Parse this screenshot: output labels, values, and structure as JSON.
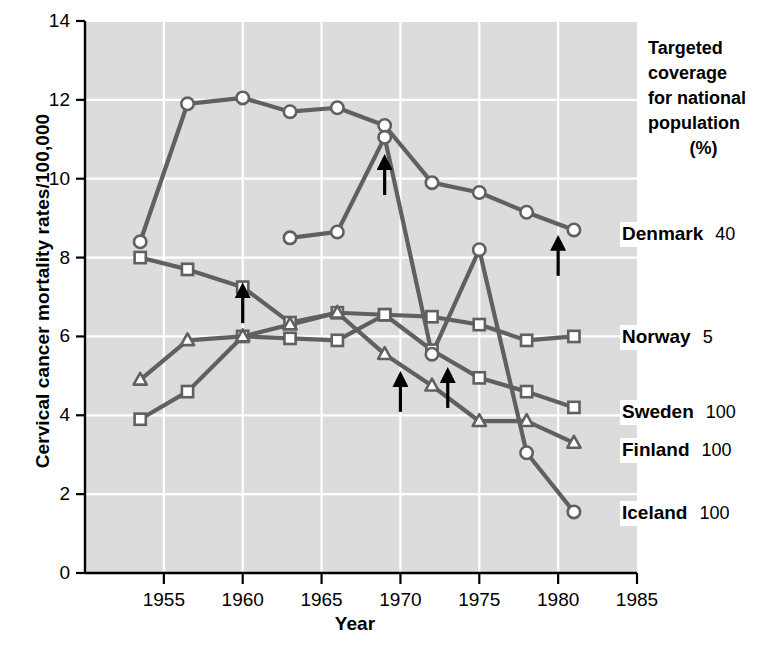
{
  "chart_data": {
    "type": "line",
    "title": "",
    "xlabel": "Year",
    "ylabel": "Cervical cancer mortality rates/100,000",
    "xlim": [
      1950,
      1985
    ],
    "ylim": [
      0,
      14
    ],
    "xticks": [
      1955,
      1960,
      1965,
      1970,
      1975,
      1980,
      1985
    ],
    "yticks": [
      0,
      2,
      4,
      6,
      8,
      10,
      12,
      14
    ],
    "grid": true,
    "legend_position": "right",
    "legend_header": [
      "Targeted",
      "coverage",
      "for national",
      "population"
    ],
    "legend_header_units": "(%)",
    "series": [
      {
        "name": "Denmark",
        "coverage": "40",
        "marker": "circle",
        "x": [
          1953.5,
          1956.5,
          1960,
          1963,
          1966,
          1969,
          1972,
          1975,
          1978,
          1981
        ],
        "y": [
          8.4,
          11.9,
          12.05,
          11.7,
          11.8,
          11.35,
          9.9,
          9.65,
          9.15,
          8.7
        ]
      },
      {
        "name": "Norway",
        "coverage": "5",
        "marker": "square",
        "x": [
          1953.5,
          1956.5,
          1960,
          1963,
          1966,
          1969,
          1972,
          1975,
          1978,
          1981
        ],
        "y": [
          8.0,
          7.7,
          7.25,
          6.35,
          6.6,
          6.55,
          6.5,
          6.3,
          5.9,
          6.0
        ]
      },
      {
        "name": "Sweden",
        "coverage": "100",
        "marker": "square",
        "x": [
          1953.5,
          1956.5,
          1960,
          1963,
          1966,
          1969,
          1972,
          1975,
          1978,
          1981
        ],
        "y": [
          3.9,
          4.6,
          6.0,
          5.95,
          5.9,
          6.55,
          5.65,
          4.95,
          4.6,
          4.2
        ]
      },
      {
        "name": "Finland",
        "coverage": "100",
        "marker": "triangle",
        "x": [
          1953.5,
          1956.5,
          1960,
          1963,
          1966,
          1969,
          1972,
          1975,
          1978,
          1981
        ],
        "y": [
          4.9,
          5.9,
          6.0,
          6.3,
          6.6,
          5.55,
          4.75,
          3.85,
          3.85,
          3.3
        ]
      },
      {
        "name": "Iceland",
        "coverage": "100",
        "marker": "circle",
        "x": [
          1963,
          1966,
          1969,
          1972,
          1975,
          1978,
          1981
        ],
        "y": [
          8.5,
          8.65,
          11.05,
          5.55,
          8.2,
          3.05,
          1.55
        ]
      }
    ],
    "annotations": [
      {
        "name": "arrow-norway-1960",
        "x": 1960,
        "y": 7.25,
        "label": "screening-start-arrow"
      },
      {
        "name": "arrow-iceland-1969",
        "x": 1969,
        "y": 10.5,
        "label": "screening-start-arrow"
      },
      {
        "name": "arrow-finland-1970",
        "x": 1970,
        "y": 5.0,
        "label": "screening-start-arrow"
      },
      {
        "name": "arrow-sweden-1973",
        "x": 1973,
        "y": 5.1,
        "label": "screening-start-arrow"
      },
      {
        "name": "arrow-denmark-1980",
        "x": 1980,
        "y": 8.45,
        "label": "screening-start-arrow"
      }
    ]
  },
  "legend": {
    "header_lines": [
      "Targeted",
      "coverage",
      "for national",
      "population"
    ],
    "units": "(%)",
    "entries": [
      {
        "name": "Denmark",
        "value": "40"
      },
      {
        "name": "Norway",
        "value": "5"
      },
      {
        "name": "Sweden",
        "value": "100"
      },
      {
        "name": "Finland",
        "value": "100"
      },
      {
        "name": "Iceland",
        "value": "100"
      }
    ]
  },
  "axes": {
    "x_title": "Year",
    "y_title": "Cervical cancer mortality rates/100,000",
    "x_ticks": [
      "1955",
      "1960",
      "1965",
      "1970",
      "1975",
      "1980",
      "1985"
    ],
    "y_ticks": [
      "0",
      "2",
      "4",
      "6",
      "8",
      "10",
      "12",
      "14"
    ]
  },
  "colors": {
    "plot_background": "#dcdcdc",
    "grid": "#ffffff",
    "line": "#606060",
    "marker_fill": "#ffffff",
    "axis": "#000000",
    "text": "#000000"
  }
}
